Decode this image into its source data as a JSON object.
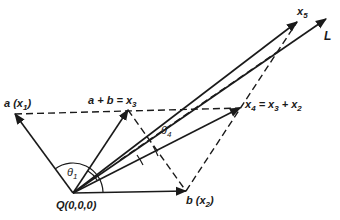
{
  "diagram": {
    "origin": {
      "label": "Q(0,0,0)",
      "x": 73,
      "y": 193
    },
    "vectors": [
      {
        "id": "a",
        "label": "a (x1)",
        "tip": [
          14,
          113
        ],
        "style": "solid"
      },
      {
        "id": "x3",
        "label": "a + b = x3",
        "tip": [
          128,
          110
        ],
        "style": "solid"
      },
      {
        "id": "b",
        "label": "b (x2)",
        "tip": [
          187,
          191
        ],
        "style": "solid"
      },
      {
        "id": "x4",
        "label": "x4 = x3 + x2",
        "tip": [
          240,
          108
        ],
        "style": "solid"
      },
      {
        "id": "x5",
        "label": "x5",
        "tip": [
          297,
          22
        ],
        "style": "solid"
      },
      {
        "id": "L",
        "label": "L",
        "tip": [
          326,
          19
        ],
        "style": "solid"
      }
    ],
    "angles": [
      {
        "label": "θ1",
        "between": [
          "a",
          "b"
        ]
      },
      {
        "label": "θ4",
        "between": [
          "x4",
          "L"
        ]
      }
    ],
    "labels": {
      "a_main": "a",
      "a_paren_open": "(x",
      "a_sub": "1",
      "a_paren_close": ")",
      "x3_main": "a + b = x",
      "x3_sub": "3",
      "b_main": "b",
      "b_paren_open": "(x",
      "b_sub": "2",
      "b_paren_close": ")",
      "x4_x": "x",
      "x4_sub": "4",
      "x4_eq": " = x",
      "x4_sub3": "3",
      "x4_plus": " + x",
      "x4_sub2": "2",
      "x5_x": "x",
      "x5_sub": "5",
      "L": "L",
      "theta1": "θ",
      "theta1_sub": "1",
      "theta4": "θ",
      "theta4_sub": "4",
      "origin": "Q(0,0,0)"
    },
    "colors": {
      "stroke": "#1a1a1a",
      "background": "#ffffff"
    }
  }
}
